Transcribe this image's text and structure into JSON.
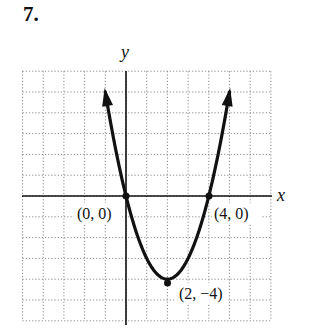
{
  "problem": {
    "number": "7."
  },
  "chart_data": {
    "type": "line",
    "title": "",
    "xlabel": "x",
    "ylabel": "y",
    "xlim": [
      -5,
      7
    ],
    "ylim": [
      -6,
      6
    ],
    "grid": true,
    "grid_style": "dotted",
    "curve": {
      "description": "upward-opening parabola with arrowheads on both ends",
      "equation": "y = x^2 - 4x",
      "x_range": [
        -1.0,
        5.0
      ]
    },
    "points": [
      {
        "x": 0,
        "y": 0,
        "label": "(0, 0)"
      },
      {
        "x": 4,
        "y": 0,
        "label": "(4, 0)"
      },
      {
        "x": 2,
        "y": -4,
        "label": "(2, -4)"
      }
    ],
    "legend": null
  },
  "labels": {
    "x_axis": "x",
    "y_axis": "y",
    "p1": "(0, 0)",
    "p2": "(4, 0)",
    "p3": "(2, −4)"
  }
}
